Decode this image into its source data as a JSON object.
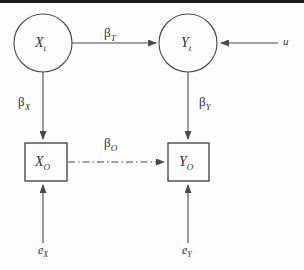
{
  "figure": {
    "type": "path-diagram"
  },
  "nodes": {
    "latent_x": {
      "id": "X_t",
      "base": "X",
      "sub": "t",
      "shape": "circle",
      "cx": 43,
      "cy": 43,
      "r": 29
    },
    "latent_y": {
      "id": "Y_t",
      "base": "Y",
      "sub": "t",
      "shape": "circle",
      "cx": 188,
      "cy": 43,
      "r": 29
    },
    "observed_x": {
      "id": "X_O",
      "base": "X",
      "sub": "O",
      "shape": "rect",
      "x": 25,
      "y": 143,
      "w": 42,
      "h": 38
    },
    "observed_y": {
      "id": "Y_O",
      "base": "Y",
      "sub": "O",
      "shape": "rect",
      "x": 168,
      "y": 143,
      "w": 41,
      "h": 38
    },
    "confounder_u": {
      "id": "u",
      "base": "u",
      "sub": "",
      "shape": "text",
      "x": 283,
      "y": 42
    },
    "error_x": {
      "id": "e_X",
      "base": "e",
      "sub": "X",
      "shape": "text",
      "x": 38,
      "y": 250
    },
    "error_y": {
      "id": "e_Y",
      "base": "e",
      "sub": "Y",
      "shape": "text",
      "x": 182,
      "y": 250
    }
  },
  "edges": [
    {
      "name": "beta-t",
      "from": "latent_x",
      "to": "latent_y",
      "style": "solid",
      "label_base": "β",
      "label_sub": "T",
      "label_x": 104,
      "label_y": 27
    },
    {
      "name": "beta-x",
      "from": "latent_x",
      "to": "observed_x",
      "style": "solid",
      "label_base": "β",
      "label_sub": "X",
      "label_x": 18,
      "label_y": 96
    },
    {
      "name": "beta-y",
      "from": "latent_y",
      "to": "observed_y",
      "style": "solid",
      "label_base": "β",
      "label_sub": "Y",
      "label_x": 199,
      "label_y": 96
    },
    {
      "name": "beta-o",
      "from": "observed_x",
      "to": "observed_y",
      "style": "dash-dot",
      "label_base": "β",
      "label_sub": "O",
      "label_x": 104,
      "label_y": 137
    },
    {
      "name": "u-to-latent-y",
      "from": "confounder_u",
      "to": "latent_y",
      "style": "solid",
      "label_base": "",
      "label_sub": "",
      "label_x": 0,
      "label_y": 0
    },
    {
      "name": "error-x-to-observed-x",
      "from": "error_x",
      "to": "observed_x",
      "style": "solid",
      "label_base": "",
      "label_sub": "",
      "label_x": 0,
      "label_y": 0
    },
    {
      "name": "error-y-to-observed-y",
      "from": "error_y",
      "to": "observed_y",
      "style": "solid",
      "label_base": "",
      "label_sub": "",
      "label_x": 0,
      "label_y": 0
    }
  ],
  "colors": {
    "stroke": "#4a4a4a",
    "text": "#333333",
    "background": "#fdfdfd",
    "top_band": "#1b1b1b"
  }
}
